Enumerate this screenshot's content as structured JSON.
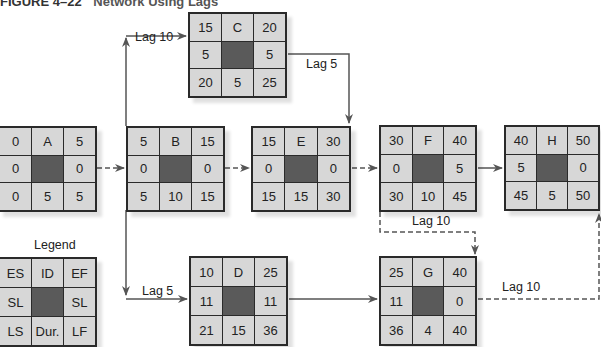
{
  "figure": {
    "number": "FIGURE 4–22",
    "caption": "Network Using Lags"
  },
  "legend": {
    "label": "Legend",
    "cells": [
      "ES",
      "ID",
      "EF",
      "SL",
      "",
      "SL",
      "LS",
      "Dur.",
      "LF"
    ]
  },
  "nodes": {
    "A": {
      "cells": [
        "0",
        "A",
        "5",
        "0",
        "",
        "0",
        "0",
        "5",
        "5"
      ]
    },
    "B": {
      "cells": [
        "5",
        "B",
        "15",
        "0",
        "",
        "0",
        "5",
        "10",
        "15"
      ]
    },
    "C": {
      "cells": [
        "15",
        "C",
        "20",
        "5",
        "",
        "5",
        "20",
        "5",
        "25"
      ]
    },
    "D": {
      "cells": [
        "10",
        "D",
        "25",
        "11",
        "",
        "11",
        "21",
        "15",
        "36"
      ]
    },
    "E": {
      "cells": [
        "15",
        "E",
        "30",
        "0",
        "",
        "0",
        "15",
        "15",
        "30"
      ]
    },
    "F": {
      "cells": [
        "30",
        "F",
        "40",
        "0",
        "",
        "5",
        "30",
        "10",
        "45"
      ]
    },
    "G": {
      "cells": [
        "25",
        "G",
        "40",
        "11",
        "",
        "0",
        "36",
        "4",
        "40"
      ]
    },
    "H": {
      "cells": [
        "40",
        "H",
        "50",
        "5",
        "",
        "0",
        "45",
        "5",
        "50"
      ]
    }
  },
  "lags": {
    "b_to_c": "Lag 10",
    "c_to_e": "Lag 5",
    "b_to_d": "Lag 5",
    "f_to_g": "Lag 10",
    "g_to_h": "Lag 10"
  },
  "colors": {
    "cell": "#d7d7d7",
    "center_cell": "#5a5a5a",
    "border": "#2a2a2a",
    "connector": "#555555"
  }
}
